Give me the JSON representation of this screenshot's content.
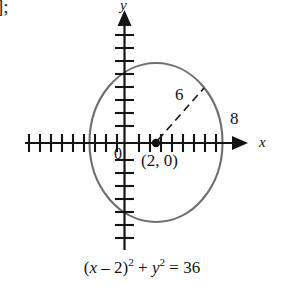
{
  "figure": {
    "kind": "coordinate-plane-circle-graph",
    "corner_artifact": "];",
    "axes": {
      "x_label": "x",
      "y_label": "y",
      "origin_label": "0",
      "tick_spacing_units": 1,
      "x_range": [
        -10,
        9
      ],
      "y_range": [
        -9,
        9
      ],
      "axis_color": "#141414"
    },
    "circle": {
      "center_label": "(2, 0)",
      "center": [
        2,
        0
      ],
      "radius": 6,
      "radius_label": "6",
      "x_intercept_right_label": "8",
      "x_intercept_right": 8,
      "x_intercept_left": -4,
      "stroke_color": "#6e6e6e"
    },
    "radius_line": {
      "style": "dashed",
      "from": [
        2,
        0
      ],
      "to_angle_deg": 45,
      "label": "6"
    },
    "equation": {
      "lhs_open": "(",
      "lhs_var": "x",
      "lhs_minus": " – 2",
      "lhs_close": ")",
      "lhs_exp": "2",
      "plus": " + ",
      "rhs_var": "y",
      "rhs_exp": "2",
      "equals": " = 36",
      "full_text": "(x – 2)² + y² = 36"
    }
  }
}
